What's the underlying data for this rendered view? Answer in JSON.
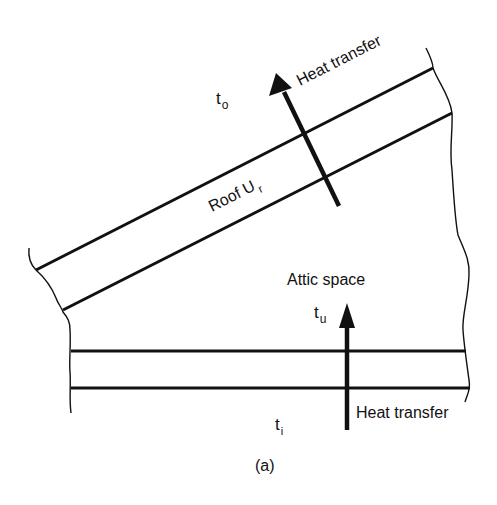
{
  "figure": {
    "caption": "(a)",
    "outside_temp": {
      "base": "t",
      "sub": "o"
    },
    "attic_temp": {
      "base": "t",
      "sub": "u"
    },
    "inside_temp": {
      "base": "t",
      "sub": "i"
    },
    "roof_label": {
      "base": "Roof U",
      "sub": "r"
    },
    "roof_heat_label": "Heat transfer",
    "attic_label": "Attic space",
    "ceiling_heat_label": "Heat transfer"
  },
  "colors": {
    "line": "#111111",
    "background": "#ffffff"
  }
}
